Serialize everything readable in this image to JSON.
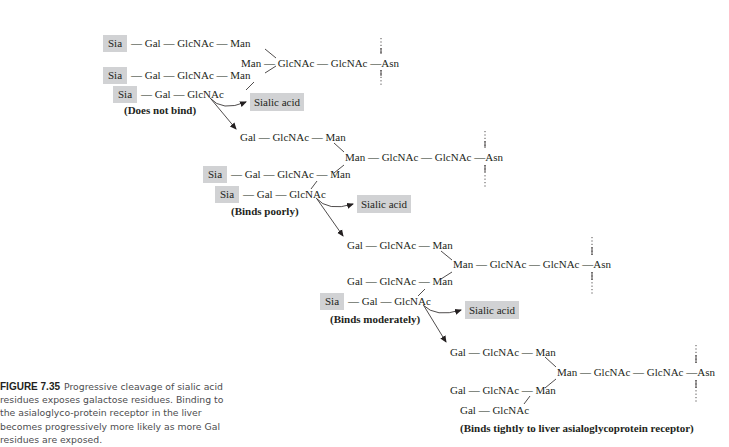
{
  "figure": {
    "number": "FIGURE 7.35",
    "caption": "Progressive cleavage of sialic acid residues exposes galactose residues. Binding to the asialoglyco-protein receptor in the liver becomes progressively more likely as more Gal residues are exposed."
  },
  "colors": {
    "highlight_box": "#d1d2d4",
    "text": "#231f20",
    "caption_text": "#4d4d4f"
  },
  "residues": {
    "sia": "Sia",
    "gal": "Gal",
    "glcnac": "GlcNAc",
    "man": "Man",
    "asn": "Asn",
    "dash": "—"
  },
  "released": "Sialic acid",
  "structures": [
    {
      "row1": "Sia — Gal — GlcNAc — Man",
      "core": "Man — GlcNAc — GlcNAc —Asn",
      "row2": "Sia — Gal — GlcNAc — Man",
      "row3": "Sia — Gal — GlcNAc",
      "label": "(Does not bind)",
      "sia_on_row1": true,
      "sia_on_row2": true,
      "sia_on_row3": true
    },
    {
      "row1": "Gal — GlcNAc — Man",
      "core": "Man — GlcNAc — GlcNAc —Asn",
      "row2": "Sia — Gal — GlcNAc — Man",
      "row3": "Sia — Gal — GlcNAc",
      "label": "(Binds poorly)",
      "sia_on_row1": false,
      "sia_on_row2": true,
      "sia_on_row3": true
    },
    {
      "row1": "Gal — GlcNAc — Man",
      "core": "Man — GlcNAc — GlcNAc —Asn",
      "row2": "Gal — GlcNAc — Man",
      "row3": "Sia — Gal — GlcNAc",
      "label": "(Binds moderately)",
      "sia_on_row1": false,
      "sia_on_row2": false,
      "sia_on_row3": true
    },
    {
      "row1": "Gal — GlcNAc — Man",
      "core": "Man — GlcNAc — GlcNAc —Asn",
      "row2": "Gal — GlcNAc — Man",
      "row3": "Gal — GlcNAc",
      "label": "(Binds tightly to liver asialoglycoprotein receptor)",
      "sia_on_row1": false,
      "sia_on_row2": false,
      "sia_on_row3": false
    }
  ]
}
